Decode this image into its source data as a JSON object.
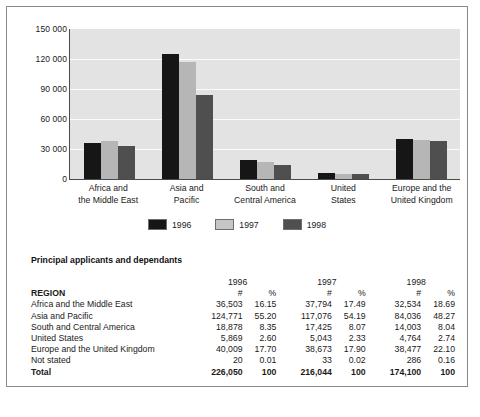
{
  "chart_data": {
    "type": "bar",
    "title": "",
    "xlabel": "",
    "ylabel": "",
    "ylim": [
      0,
      150000
    ],
    "yticks": [
      "150 000",
      "120 000",
      "90 000",
      "60 000",
      "30 000",
      "0"
    ],
    "ytick_values": [
      150000,
      120000,
      90000,
      60000,
      30000,
      0
    ],
    "grid": true,
    "legend_position": "bottom",
    "categories": [
      "Africa and\nthe Middle East",
      "Asia and\nPacific",
      "South and\nCentral America",
      "United\nStates",
      "Europe and the\nUnited Kingdom"
    ],
    "category_lines": [
      [
        "Africa and",
        "the Middle East"
      ],
      [
        "Asia and",
        "Pacific"
      ],
      [
        "South and",
        "Central America"
      ],
      [
        "United",
        "States"
      ],
      [
        "Europe and the",
        "United Kingdom"
      ]
    ],
    "series": [
      {
        "name": "1996",
        "color": "#161616",
        "values": [
          36503,
          124771,
          18878,
          5869,
          40009
        ]
      },
      {
        "name": "1997",
        "color": "#b6b6b6",
        "values": [
          37794,
          117076,
          17425,
          5043,
          38673
        ]
      },
      {
        "name": "1998",
        "color": "#4f4f4f",
        "values": [
          32534,
          84036,
          14003,
          4764,
          38477
        ]
      }
    ]
  },
  "legend": {
    "items": [
      {
        "label": "1996",
        "swatch": "s1996"
      },
      {
        "label": "1997",
        "swatch": "s1997"
      },
      {
        "label": "1998",
        "swatch": "s1998"
      }
    ]
  },
  "table": {
    "caption": "Principal applicants and dependants",
    "year_headers": [
      "1996",
      "1997",
      "1998"
    ],
    "region_header": "REGION",
    "sub_headers": [
      "#",
      "%",
      "#",
      "%",
      "#",
      "%"
    ],
    "rows": [
      {
        "region": "Africa and the Middle East",
        "cells": [
          "36,503",
          "16.15",
          "37,794",
          "17.49",
          "32,534",
          "18.69"
        ]
      },
      {
        "region": "Asia and Pacific",
        "cells": [
          "124,771",
          "55.20",
          "117,076",
          "54.19",
          "84,036",
          "48.27"
        ]
      },
      {
        "region": "South and Central America",
        "cells": [
          "18,878",
          "8.35",
          "17,425",
          "8.07",
          "14,003",
          "8.04"
        ]
      },
      {
        "region": "United States",
        "cells": [
          "5,869",
          "2.60",
          "5,043",
          "2.33",
          "4,764",
          "2.74"
        ]
      },
      {
        "region": "Europe and the United Kingdom",
        "cells": [
          "40,009",
          "17.70",
          "38,673",
          "17.90",
          "38,477",
          "22.10"
        ]
      },
      {
        "region": "Not stated",
        "cells": [
          "20",
          "0.01",
          "33",
          "0.02",
          "286",
          "0.16"
        ]
      }
    ],
    "total": {
      "region": "Total",
      "cells": [
        "226,050",
        "100",
        "216,044",
        "100",
        "174,100",
        "100"
      ]
    }
  },
  "colors": {
    "series_1996": "#161616",
    "series_1997": "#b6b6b6",
    "series_1998": "#4f4f4f",
    "plot_background": "#e3e3e3",
    "gridline": "#fbfbfb",
    "frame_border": "#8a8a8a"
  }
}
